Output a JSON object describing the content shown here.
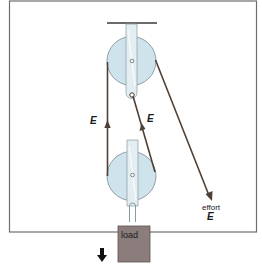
{
  "diagram": {
    "labels": {
      "tension_left": "E",
      "tension_right": "E",
      "effort_word": "effort",
      "effort_symbol": "E",
      "load": "load"
    },
    "colors": {
      "frame": "#6e6e6e",
      "pulley_fill": "#cfe3ec",
      "pulley_stroke": "#7c8b93",
      "bracket_fill": "#e3eef2",
      "rope": "#4f4036",
      "load_fill": "#8a7d7c",
      "load_stroke": "#5e5352",
      "text": "#1a1a1a"
    }
  }
}
